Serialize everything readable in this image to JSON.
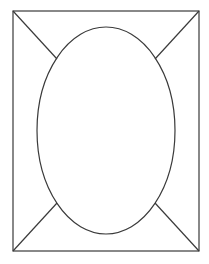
{
  "diagram": {
    "type": "frame-with-ellipse",
    "canvas": {
      "width": 209,
      "height": 264,
      "background": "#ffffff"
    },
    "stroke_color": "#3a3a3a",
    "rectangle": {
      "x": 13,
      "y": 11,
      "width": 186,
      "height": 240
    },
    "ellipse": {
      "cx": 106,
      "cy": 130.5,
      "rx": 69,
      "ry": 103.5
    },
    "diagonals": [
      {
        "name": "top-left",
        "x1": 13,
        "y1": 11,
        "x2": 57,
        "y2": 59
      },
      {
        "name": "top-right",
        "x1": 199,
        "y1": 11,
        "x2": 155,
        "y2": 59
      },
      {
        "name": "bottom-left",
        "x1": 13,
        "y1": 251,
        "x2": 57,
        "y2": 203
      },
      {
        "name": "bottom-right",
        "x1": 199,
        "y1": 251,
        "x2": 155,
        "y2": 203
      }
    ]
  }
}
